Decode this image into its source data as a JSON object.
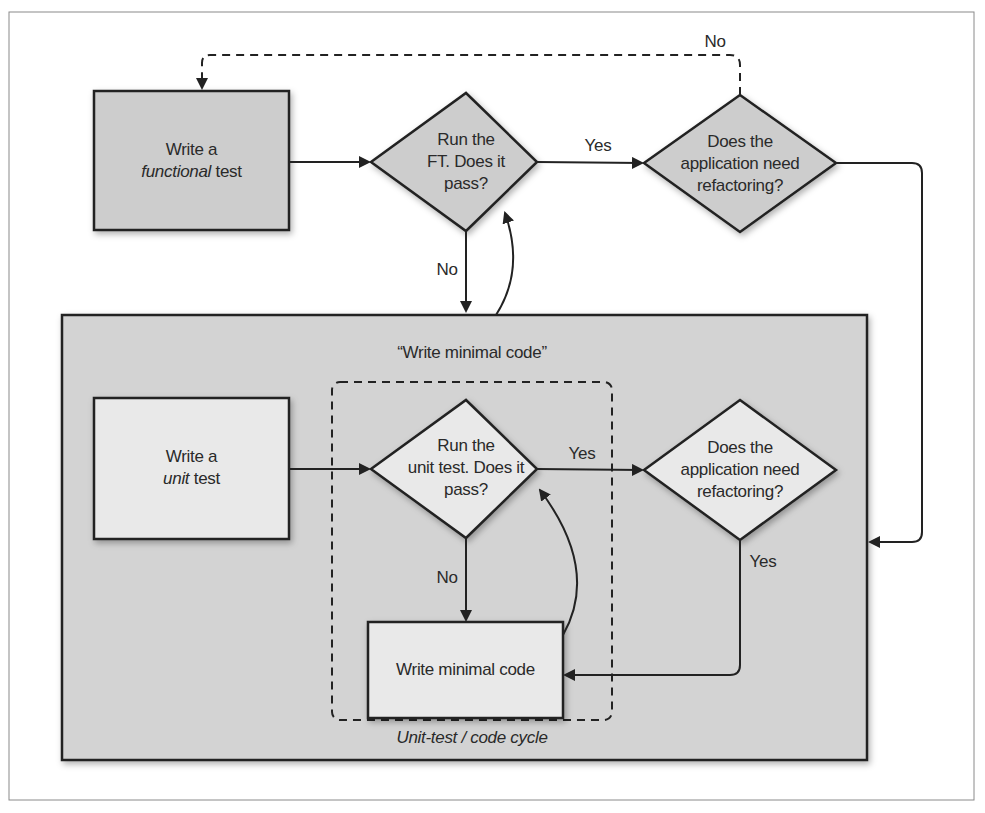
{
  "diagram": {
    "nodes": {
      "write_functional_test": {
        "line1": "Write a",
        "line2_italic": "functional",
        "line2_rest": " test"
      },
      "run_ft": {
        "lines": [
          "Run the",
          "FT. Does it",
          "pass?"
        ]
      },
      "refactor_top": {
        "lines": [
          "Does the",
          "application need",
          "refactoring?"
        ]
      },
      "write_unit_test": {
        "line1": "Write a",
        "line2_italic": "unit",
        "line2_rest": " test"
      },
      "run_unit_test": {
        "lines": [
          "Run the",
          "unit test. Does it",
          "pass?"
        ]
      },
      "refactor_inner": {
        "lines": [
          "Does the",
          "application need",
          "refactoring?"
        ]
      },
      "write_minimal_code": {
        "label": "Write minimal code"
      }
    },
    "group_labels": {
      "outer_box_title": "“Write minimal code”",
      "inner_cycle_caption": "Unit-test / code cycle"
    },
    "edge_labels": {
      "ft_yes": "Yes",
      "ft_no": "No",
      "refactor_top_no": "No",
      "unit_yes": "Yes",
      "unit_no": "No",
      "refactor_inner_yes": "Yes"
    },
    "colors": {
      "outer_fill": "#d3d3d3",
      "top_shape_fill": "#cdcdcd",
      "inner_shape_fill": "#e9e9e9",
      "stroke": "#222222"
    }
  }
}
